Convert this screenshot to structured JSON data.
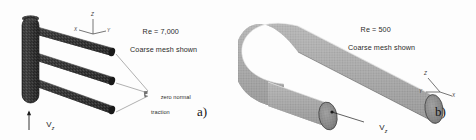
{
  "figure": {
    "background": "#fdfdfd",
    "width": 476,
    "height": 140
  },
  "panel_a": {
    "subfigure_label": "a)",
    "conditions": {
      "reynolds": "Re = 7,000",
      "mesh_note": "Coarse mesh shown"
    },
    "boundary_condition": {
      "line1": "zero normal",
      "line2": "traction"
    },
    "velocity_label": {
      "symbol": "V",
      "subscript": "z"
    },
    "axis_triad": {
      "z": "Z",
      "x": "X",
      "y": "Y"
    },
    "geometry": {
      "name": "three-branch-manifold",
      "mesh_color": "#3a3a3a",
      "branch_count": 3
    }
  },
  "panel_b": {
    "subfigure_label": "b)",
    "conditions": {
      "reynolds": "Re = 500",
      "mesh_note": "Coarse mesh shown"
    },
    "velocity_label": {
      "symbol": "V",
      "subscript": "z"
    },
    "axis_triad": {
      "z": "Z",
      "y": "Y",
      "x": "X"
    },
    "geometry": {
      "name": "u-bend-pipe",
      "mesh_color": "#8c8c8c"
    }
  }
}
